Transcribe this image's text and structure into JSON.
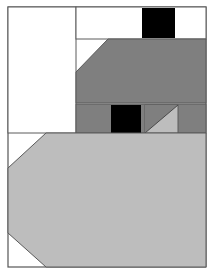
{
  "canvas": {
    "width": 215,
    "height": 274,
    "background": "#ffffff",
    "title": "Abstract Geometric Composition"
  },
  "palette": {
    "white": "#ffffff",
    "light_gray": "#bdbdbd",
    "dark_gray": "#7f7f7f",
    "black": "#000000",
    "border": "#555555",
    "line": "#5a5a5a"
  },
  "frame": {
    "x": 8,
    "y": 7,
    "width": 198,
    "height": 260,
    "stroke": "#555555",
    "stroke_width": 1.2,
    "fill": "#ffffff"
  },
  "shapes": [
    {
      "id": "top-left-white-panel",
      "name": "top-left-white-panel",
      "type": "rect",
      "fill": "#ffffff",
      "stroke": "#5a5a5a",
      "stroke_width": 1,
      "x": 8,
      "y": 7,
      "width": 68,
      "height": 126
    },
    {
      "id": "top-right-white-strip",
      "name": "top-right-white-strip",
      "type": "rect",
      "fill": "#ffffff",
      "stroke": "#5a5a5a",
      "stroke_width": 1,
      "x": 76,
      "y": 7,
      "width": 130,
      "height": 32
    },
    {
      "id": "top-black-square",
      "name": "top-black-square",
      "type": "rect",
      "fill": "#000000",
      "stroke": "none",
      "stroke_width": 0,
      "x": 142,
      "y": 8,
      "width": 33,
      "height": 30
    },
    {
      "id": "dark-gray-upper-mass",
      "name": "dark-gray-upper-mass",
      "type": "polygon",
      "fill": "#7f7f7f",
      "stroke": "#5a5a5a",
      "stroke_width": 1,
      "points": "108,39 206,39 206,103 76,103 76,72"
    },
    {
      "id": "dark-gray-middle-band",
      "name": "dark-gray-middle-band",
      "type": "rect",
      "fill": "#7f7f7f",
      "stroke": "#5a5a5a",
      "stroke_width": 1,
      "x": 76,
      "y": 104,
      "width": 130,
      "height": 29
    },
    {
      "id": "middle-black-square",
      "name": "middle-black-square",
      "type": "rect",
      "fill": "#000000",
      "stroke": "none",
      "stroke_width": 0,
      "x": 111,
      "y": 105,
      "width": 30,
      "height": 28
    },
    {
      "id": "middle-light-gray-cell",
      "name": "middle-light-gray-cell",
      "type": "rect",
      "fill": "#bdbdbd",
      "stroke": "#5a5a5a",
      "stroke_width": 1,
      "x": 145,
      "y": 105,
      "width": 33,
      "height": 28
    },
    {
      "id": "middle-dark-triangle-overlay",
      "name": "middle-dark-triangle-overlay",
      "type": "polygon",
      "fill": "#7f7f7f",
      "stroke": "none",
      "stroke_width": 0,
      "points": "145,105 178,105 145,133"
    },
    {
      "id": "middle-cell-diagonal",
      "name": "middle-cell-diagonal",
      "type": "line",
      "stroke": "#4a4a4a",
      "stroke_width": 1,
      "x1": 145,
      "y1": 133,
      "x2": 178,
      "y2": 105
    },
    {
      "id": "bottom-light-gray-mass",
      "name": "bottom-light-gray-mass",
      "type": "polygon",
      "fill": "#bdbdbd",
      "stroke": "#5a5a5a",
      "stroke_width": 1,
      "points": "46,133 206,133 206,267 46,267 8,233 8,168"
    }
  ],
  "regions": {
    "top_left_white": "large white rectangle, upper left quadrant",
    "top_black": "solid black square in the upper white strip",
    "dark_gray": "large medium-gray mass with angled upper-left corner",
    "middle_band": "horizontal gray band containing a black square and a diagonal-split light cell",
    "bottom_light_gray": "large light gray hexagonal mass occupying the lower half"
  }
}
